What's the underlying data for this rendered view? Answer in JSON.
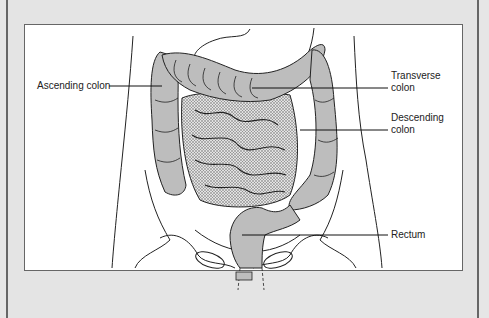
{
  "figure": {
    "labels": {
      "ascending": "Ascending colon",
      "transverse_1": "Transverse",
      "transverse_2": "colon",
      "descending_1": "Descending",
      "descending_2": "colon",
      "rectum": "Rectum"
    },
    "colors": {
      "frame": "#e4e4e4",
      "panel": "#ffffff",
      "colon_fill": "#bdbdbd",
      "intestine_fill": "#d0d0d0",
      "outline": "#222222"
    }
  }
}
